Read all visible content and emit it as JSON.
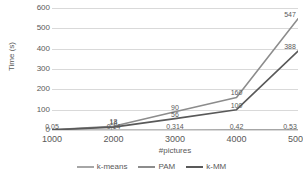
{
  "chart_data": {
    "type": "line",
    "title": "",
    "xlabel": "#pictures",
    "ylabel": "Time (s)",
    "x": [
      1000,
      2000,
      3000,
      4000,
      5000
    ],
    "xtick_labels": [
      "1000",
      "2000",
      "3000",
      "4000",
      "5000"
    ],
    "ytick_labels": [
      "0",
      "100",
      "200",
      "300",
      "400",
      "500",
      "600"
    ],
    "ytick_values": [
      0,
      100,
      200,
      300,
      400,
      500,
      600
    ],
    "ylim": [
      0,
      600
    ],
    "xlim": [
      1000,
      5000
    ],
    "grid": true,
    "legend_position": "bottom",
    "series": [
      {
        "name": "k-means",
        "color": "#a6a6a6",
        "values": [
          0.05,
          0.14,
          0.314,
          0.42,
          0.53
        ],
        "labels": [
          "0,05",
          "0,14",
          "0,314",
          "0,42",
          "0,53"
        ]
      },
      {
        "name": "PAM",
        "color": "#8c8c8c",
        "values": [
          0.9,
          18,
          90,
          160,
          547
        ],
        "labels": [
          "0,9",
          "18",
          "90",
          "160",
          "547"
        ]
      },
      {
        "name": "k-MM",
        "color": "#595959",
        "values": [
          0.5,
          14,
          56,
          100,
          388
        ],
        "labels": [
          "0,5",
          "14",
          "56",
          "100",
          "388"
        ]
      }
    ],
    "visible_data_labels": [
      {
        "series": "k-means",
        "text": "0,05",
        "x": 1000,
        "y": 0.05
      },
      {
        "series": "k-means",
        "text": "0,14",
        "x": 2000,
        "y": 0.14
      },
      {
        "series": "k-means",
        "text": "0,314",
        "x": 3000,
        "y": 0.314
      },
      {
        "series": "k-means",
        "text": "0,42",
        "x": 4000,
        "y": 0.42
      },
      {
        "series": "k-means",
        "text": "0,53",
        "x": 5000,
        "y": 0.53
      },
      {
        "series": "PAM",
        "text": "18",
        "x": 2000,
        "y": 18
      },
      {
        "series": "PAM",
        "text": "90",
        "x": 3000,
        "y": 90
      },
      {
        "series": "PAM",
        "text": "160",
        "x": 4000,
        "y": 160
      },
      {
        "series": "PAM",
        "text": "547",
        "x": 5000,
        "y": 547
      },
      {
        "series": "k-MM",
        "text": "14",
        "x": 2000,
        "y": 14
      },
      {
        "series": "k-MM",
        "text": "56",
        "x": 3000,
        "y": 56
      },
      {
        "series": "k-MM",
        "text": "100",
        "x": 4000,
        "y": 100
      },
      {
        "series": "k-MM",
        "text": "388",
        "x": 5000,
        "y": 388
      }
    ]
  },
  "legend": {
    "items": [
      {
        "label": "k-means",
        "color": "#a6a6a6"
      },
      {
        "label": "PAM",
        "color": "#8c8c8c"
      },
      {
        "label": "k-MM",
        "color": "#595959"
      }
    ]
  },
  "axes": {
    "y_title": "Time (s)",
    "x_title": "#pictures"
  },
  "colors": {
    "background": "#ffffff",
    "gridline": "#d9d9d9",
    "text": "#595959"
  }
}
